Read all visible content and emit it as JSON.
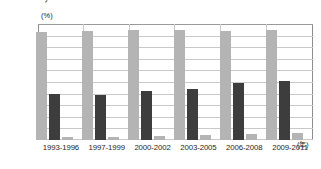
{
  "top_fragment": "ﾌﾞ",
  "axis": {
    "y_unit": "(%)",
    "x_unit": "(年)",
    "y_ticks": [
      "100.0",
      "90.0",
      "80.0",
      "70.0",
      "60.0",
      "50.0",
      "40.0",
      "30.0",
      "20.0",
      "10.0",
      "0"
    ]
  },
  "chart_data": {
    "type": "bar",
    "title": "",
    "xlabel": "(年)",
    "ylabel": "(%)",
    "ylim": [
      0,
      100
    ],
    "grid": true,
    "legend": "none",
    "categories": [
      "1993-1996",
      "1997-1999",
      "2000-2002",
      "2003-2005",
      "2006-2008",
      "2009-2011"
    ],
    "series": [
      {
        "name": "series-1",
        "color": "#b4b4b4",
        "values": [
          94.0,
          95.0,
          95.5,
          95.5,
          95.0,
          96.0
        ]
      },
      {
        "name": "series-2",
        "color": "#3d3d3d",
        "values": [
          40.0,
          39.5,
          43.0,
          44.5,
          50.0,
          51.5
        ]
      },
      {
        "name": "series-3",
        "color": "#b4b4b4",
        "values": [
          2.5,
          2.5,
          3.5,
          4.5,
          5.5,
          6.0
        ]
      }
    ]
  }
}
